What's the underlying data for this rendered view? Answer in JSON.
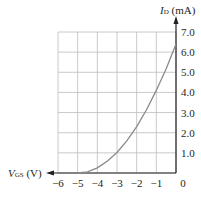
{
  "chart_data": {
    "type": "line",
    "title": "",
    "xlabel": "V_GS (V)",
    "ylabel": "I_D (mA)",
    "xlabel_main": "V",
    "xlabel_sub": "GS",
    "xlabel_unit": "(V)",
    "ylabel_main": "I",
    "ylabel_sub": "D",
    "ylabel_unit": "(mA)",
    "xlim": [
      -6,
      0
    ],
    "ylim": [
      0,
      7
    ],
    "grid": true,
    "x_ticks": [
      "−6",
      "−5",
      "−4",
      "−3",
      "−2",
      "−1",
      "0"
    ],
    "y_ticks": [
      "1.0",
      "2.0",
      "3.0",
      "4.0",
      "5.0",
      "6.0",
      "7.0"
    ],
    "series": [
      {
        "name": "Transfer characteristic",
        "x": [
          -5.0,
          -4.5,
          -4.0,
          -3.5,
          -3.0,
          -2.5,
          -2.0,
          -1.5,
          -1.0,
          -0.5,
          0.0
        ],
        "y": [
          0.0,
          0.06,
          0.26,
          0.58,
          1.02,
          1.6,
          2.3,
          3.14,
          4.1,
          5.18,
          6.4
        ]
      }
    ],
    "colors": {
      "curve": "#8a8a8a",
      "grid": "#bdbdbd",
      "axis": "#231f20"
    }
  }
}
